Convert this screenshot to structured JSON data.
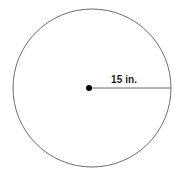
{
  "figure": {
    "name": "circle-with-radius-diagram",
    "type": "geometry-diagram",
    "shape": "circle",
    "background_color": "#ffffff",
    "stroke_color": "#6a6a70",
    "center_dot_color": "#000000",
    "label_color": "#231f20",
    "circle": {
      "center_x": 92,
      "center_y": 88,
      "radius_px": 79,
      "fill": "none"
    },
    "center_point": {
      "x": 89,
      "y": 88,
      "radius_px": 3
    },
    "radius_segment": {
      "from_x": 89,
      "from_y": 88,
      "to_x": 171,
      "to_y": 88
    },
    "radius_label": "15 in.",
    "radius_value": 15,
    "radius_units": "in."
  }
}
